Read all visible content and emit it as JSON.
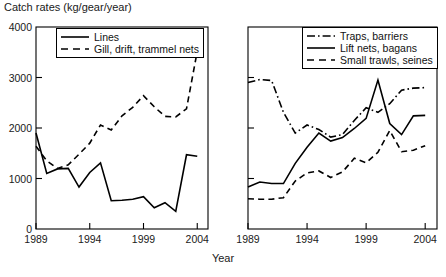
{
  "chart_data": {
    "type": "line",
    "title": "",
    "ylabel": "Catch rates (kg/gear/year)",
    "xlabel": "Year",
    "xlim": [
      1989,
      2005
    ],
    "ylim": [
      0,
      4000
    ],
    "grid": false,
    "panels": [
      {
        "name": "left-panel",
        "legend_position": "top-left",
        "y_tick_labels": [
          "0",
          "1000",
          "2000",
          "3000",
          "4000"
        ],
        "y_ticks": [
          0,
          1000,
          2000,
          3000,
          4000
        ],
        "x_tick_labels": [
          "1989",
          "1994",
          "1999",
          "2004"
        ],
        "x_ticks": [
          1989,
          1994,
          1999,
          2004
        ],
        "x": [
          1989,
          1990,
          1991,
          1992,
          1993,
          1994,
          1995,
          1996,
          1997,
          1998,
          1999,
          2000,
          2001,
          2002,
          2003,
          2004
        ],
        "series": [
          {
            "name": "Lines",
            "style": "solid",
            "values": [
              1900,
              1100,
              1190,
              1200,
              830,
              1120,
              1310,
              560,
              570,
              590,
              640,
              420,
              520,
              350,
              1470,
              1440
            ]
          },
          {
            "name": "Gill, drift, trammel nets",
            "style": "dashed",
            "values": [
              1640,
              1350,
              1200,
              1270,
              1480,
              1700,
              2060,
              1960,
              2240,
              2410,
              2640,
              2420,
              2230,
              2220,
              2380,
              3520
            ]
          }
        ]
      },
      {
        "name": "right-panel",
        "legend_position": "top-right",
        "y_tick_labels": [
          "",
          "",
          "",
          "",
          ""
        ],
        "y_ticks": [
          0,
          1000,
          2000,
          3000,
          4000
        ],
        "x_tick_labels": [
          "1989",
          "1994",
          "1999",
          "2004"
        ],
        "x_ticks": [
          1989,
          1994,
          1999,
          2004
        ],
        "x": [
          1989,
          1990,
          1991,
          1992,
          1993,
          1994,
          1995,
          1996,
          1997,
          1998,
          1999,
          2000,
          2001,
          2002,
          2003,
          2004
        ],
        "series": [
          {
            "name": "Traps, barriers",
            "style": "dashdot",
            "values": [
              2900,
              2960,
              2940,
              2310,
              1900,
              2060,
              1970,
              1820,
              1870,
              2150,
              2400,
              2310,
              2480,
              2750,
              2790,
              2800
            ]
          },
          {
            "name": "Lift nets, bagans",
            "style": "solid",
            "values": [
              830,
              930,
              900,
              900,
              1300,
              1620,
              1900,
              1740,
              1810,
              1990,
              2190,
              2950,
              2090,
              1870,
              2240,
              2250
            ]
          },
          {
            "name": "Small trawls, seines",
            "style": "dashed",
            "values": [
              600,
              590,
              590,
              620,
              950,
              1110,
              1150,
              1020,
              1130,
              1400,
              1310,
              1520,
              1950,
              1530,
              1560,
              1650
            ]
          }
        ]
      }
    ]
  }
}
